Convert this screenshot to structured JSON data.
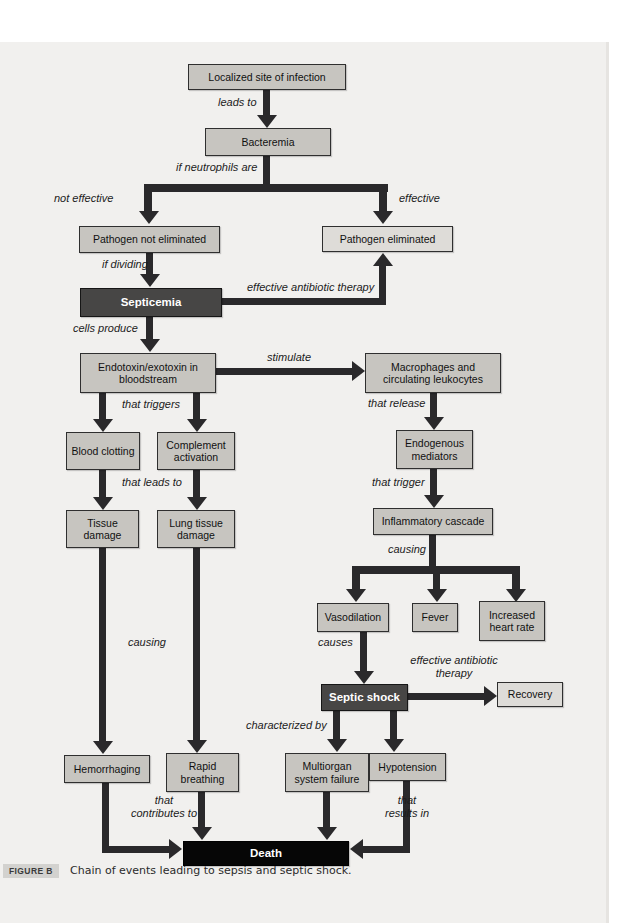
{
  "figure": {
    "caption_label": "FIGURE B",
    "caption_text": "Chain of events leading to sepsis and septic shock."
  },
  "colors": {
    "page_background": "#f1f0ee",
    "box_fill": "#c7c5c0",
    "box_fill_light": "#dedcd8",
    "box_fill_dark": "#474645",
    "box_fill_black": "#060606",
    "arrow": "#2a292b"
  },
  "nodes": {
    "localized": "Localized site of infection",
    "bacteremia": "Bacteremia",
    "pathogen_not_eliminated": "Pathogen not eliminated",
    "pathogen_eliminated": "Pathogen eliminated",
    "septicemia": "Septicemia",
    "endotoxin": "Endotoxin/exotoxin in bloodstream",
    "macrophages": "Macrophages and circulating leukocytes",
    "blood_clotting": "Blood clotting",
    "complement": "Complement activation",
    "endogenous": "Endogenous mediators",
    "tissue_damage": "Tissue damage",
    "lung_tissue": "Lung tissue damage",
    "inflammatory": "Inflammatory cascade",
    "vasodilation": "Vasodilation",
    "fever": "Fever",
    "increased_hr": "Increased heart rate",
    "septic_shock": "Septic shock",
    "recovery": "Recovery",
    "hemorrhaging": "Hemorrhaging",
    "rapid_breathing": "Rapid breathing",
    "multiorgan": "Multiorgan system failure",
    "hypotension": "Hypotension",
    "death": "Death"
  },
  "edge_labels": {
    "leads_to": "leads to",
    "if_neutrophils": "if neutrophils are",
    "not_effective": "not effective",
    "effective": "effective",
    "if_dividing": "if dividing",
    "effective_antibiotic_1": "effective antibiotic therapy",
    "cells_produce": "cells produce",
    "stimulate": "stimulate",
    "that_triggers": "that triggers",
    "that_release": "that release",
    "that_leads_to": "that leads to",
    "that_trigger": "that trigger",
    "causing_right": "causing",
    "causing_left": "causing",
    "causes": "causes",
    "effective_antibiotic_2": "effective antibiotic therapy",
    "characterized_by": "characterized by",
    "that_contributes": "that contributes to",
    "that_results": "that results in"
  }
}
